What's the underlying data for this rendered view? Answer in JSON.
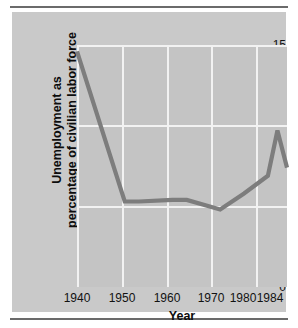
{
  "chart_data": {
    "type": "line",
    "title": "",
    "subtitle": "",
    "xlabel": "Year",
    "ylabel_line1": "Unemployment as",
    "ylabel_line2": "percentage of civilian labor force",
    "xlim": [
      1940,
      1984
    ],
    "ylim": [
      0,
      15
    ],
    "y_ticks": [
      "0",
      "5",
      "10",
      "15"
    ],
    "y_tick_values": [
      0,
      5,
      10,
      15
    ],
    "x_ticks": [
      "1940",
      "1950",
      "1960",
      "1970",
      "1980",
      "1984"
    ],
    "x_tick_values": [
      1940,
      1950,
      1960,
      1970,
      1980,
      1984
    ],
    "grid": "white gridlines on gray panel, horizontal at y=5,10,15 and vertical at each decade",
    "legend": "none",
    "series": [
      {
        "name": "Unemployment rate",
        "color": "#7d7d7d",
        "x": [
          1940,
          1950,
          1953,
          1960,
          1963,
          1970,
          1975,
          1980,
          1982,
          1984
        ],
        "values": [
          14.6,
          5.3,
          5.3,
          5.4,
          5.4,
          4.8,
          5.8,
          6.9,
          9.7,
          7.4
        ]
      }
    ],
    "annotations": [
      "Line starts at about 14.6% in 1940",
      "Drops steeply to about 5.3% by 1950",
      "Stays near 5% through the 1950s and 1960s",
      "Dips to a low of about 4.8% around 1970",
      "Rises to a peak of about 9.7% around 1982",
      "Falls to about 7.4% by 1984"
    ]
  },
  "colors": {
    "page_background": "#ffffff",
    "panel_background": "#c9c9c9",
    "plot_background": "#c4c4c4",
    "gridline": "#f2f2f2",
    "line": "#7d7d7d",
    "rule": "#6b6b6b",
    "text": "#121212"
  }
}
